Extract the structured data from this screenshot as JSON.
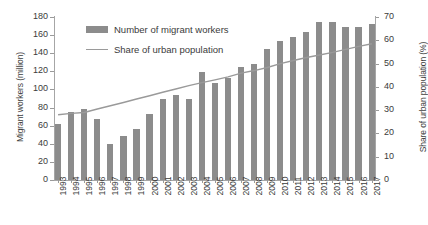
{
  "chart_data": {
    "type": "bar",
    "title": "",
    "xlabel": "",
    "ylabel": "Migrant workers (million)",
    "y2label": "Share of urban population (%)",
    "categories": [
      "1993",
      "1994",
      "1995",
      "1996",
      "1997",
      "1998",
      "1999",
      "2000",
      "2001",
      "2002",
      "2003",
      "2004",
      "2005",
      "2006",
      "2007",
      "2008",
      "2009",
      "2010",
      "2011",
      "2012",
      "2013",
      "2014",
      "2015",
      "2016",
      "2017"
    ],
    "series": [
      {
        "name": "Number of migrant workers",
        "type": "bar",
        "axis": "left",
        "unit": "million",
        "color": "#8c8c8c",
        "values": [
          62,
          75,
          78,
          67,
          40,
          49,
          56,
          73,
          89,
          94,
          90,
          119,
          107,
          113,
          125,
          128,
          145,
          153,
          158,
          163,
          174,
          175,
          169,
          169,
          172
        ]
      },
      {
        "name": "Share of urban population",
        "type": "line",
        "axis": "right",
        "unit": "%",
        "color": "#9a9a9a",
        "values": [
          28.0,
          28.6,
          29.0,
          30.5,
          31.9,
          33.3,
          34.8,
          36.2,
          37.7,
          39.1,
          40.5,
          41.8,
          43.0,
          44.3,
          45.9,
          47.0,
          48.3,
          50.0,
          51.3,
          52.6,
          53.7,
          54.8,
          56.1,
          57.4,
          58.5
        ]
      }
    ],
    "ylim": [
      0,
      180
    ],
    "yticks": [
      0,
      20,
      40,
      60,
      80,
      100,
      120,
      140,
      160,
      180
    ],
    "y2lim": [
      0,
      70
    ],
    "y2ticks": [
      0,
      10,
      20,
      30,
      40,
      50,
      60,
      70
    ],
    "grid": false,
    "legend_position": "upper left",
    "legend": [
      "Number of migrant workers",
      "Share of urban population"
    ]
  }
}
